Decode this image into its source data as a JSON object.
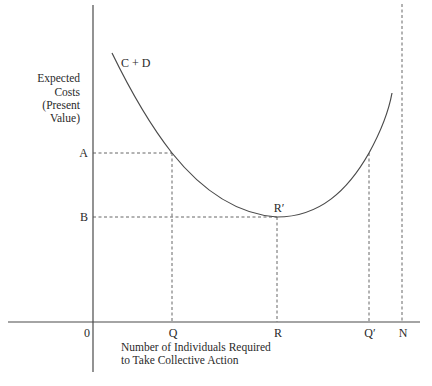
{
  "diagram": {
    "y_axis_label": [
      "Expected",
      "Costs",
      "(Present",
      "Value)"
    ],
    "x_axis_label": [
      "Number of Individuals Required",
      "to Take Collective Action"
    ],
    "curve_label": "C + D",
    "origin_label": "0",
    "y_ticks": [
      {
        "label": "A",
        "y": 153
      },
      {
        "label": "B",
        "y": 217
      }
    ],
    "x_ticks": [
      {
        "label": "Q",
        "x": 172
      },
      {
        "label": "R",
        "x": 277
      },
      {
        "label": "Q′",
        "x": 369
      },
      {
        "label": "N",
        "x": 402
      }
    ],
    "min_point_label": "R′",
    "colors": {
      "line": "#4a4a4a",
      "text": "#2a2a2a",
      "background": "#ffffff"
    }
  }
}
